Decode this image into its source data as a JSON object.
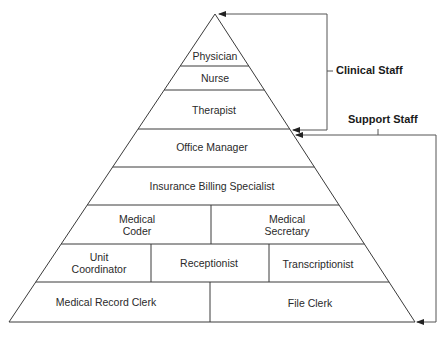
{
  "diagram": {
    "type": "pyramid-hierarchy",
    "tiers": [
      {
        "label": "Physician"
      },
      {
        "label": "Nurse"
      },
      {
        "label": "Therapist"
      },
      {
        "label": "Office Manager"
      },
      {
        "label": "Insurance Billing Specialist"
      },
      {
        "cells": [
          {
            "label": "Medical\nCoder",
            "l1": "Medical",
            "l2": "Coder"
          },
          {
            "label": "Medical\nSecretary",
            "l1": "Medical",
            "l2": "Secretary"
          }
        ]
      },
      {
        "cells": [
          {
            "label": "Unit\nCoordinator",
            "l1": "Unit",
            "l2": "Coordinator"
          },
          {
            "label": "Receptionist"
          },
          {
            "label": "Transcriptionist"
          }
        ]
      },
      {
        "cells": [
          {
            "label": "Medical Record Clerk"
          },
          {
            "label": "File Clerk"
          }
        ]
      }
    ],
    "brackets": {
      "clinical": {
        "label": "Clinical Staff",
        "covers": [
          "Physician",
          "Nurse",
          "Therapist"
        ]
      },
      "support": {
        "label": "Support Staff",
        "covers": [
          "Office Manager",
          "Insurance Billing Specialist",
          "Medical Coder",
          "Medical Secretary",
          "Unit Coordinator",
          "Receptionist",
          "Transcriptionist",
          "Medical Record Clerk",
          "File Clerk"
        ]
      }
    },
    "line_color": "#3a3a3a"
  }
}
